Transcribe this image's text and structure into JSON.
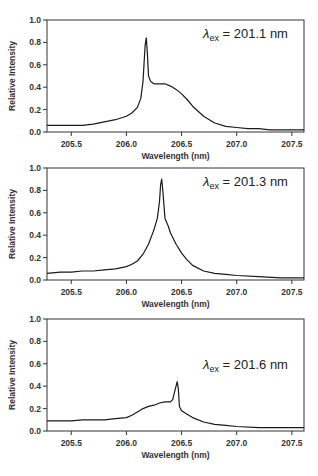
{
  "figure": {
    "panel_count": 3,
    "line_color": "#1a1a1a",
    "frame_color": "#333333"
  },
  "chart_data": [
    {
      "type": "line",
      "title": "",
      "annotation": {
        "symbol": "λ",
        "subscript": "ex",
        "text": " = 201.1 nm"
      },
      "xlabel": "Wavelength (nm)",
      "ylabel": "Relative Intensity",
      "xlim": [
        205.28,
        207.61
      ],
      "ylim": [
        0.0,
        1.0
      ],
      "xticks": [
        205.5,
        206.0,
        206.5,
        207.0,
        207.5
      ],
      "xtick_labels": [
        "205.5",
        "206.0",
        "206.5",
        "207.0",
        "207.5"
      ],
      "yticks": [
        0.0,
        0.2,
        0.4,
        0.6,
        0.8,
        1.0
      ],
      "ytick_labels": [
        "0.0",
        "0.2",
        "0.4",
        "0.6",
        "0.8",
        "1.0"
      ],
      "grid": false,
      "series": [
        {
          "name": "λex = 201.1 nm",
          "x": [
            205.28,
            205.4,
            205.5,
            205.6,
            205.7,
            205.8,
            205.9,
            206.0,
            206.05,
            206.1,
            206.13,
            206.15,
            206.16,
            206.17,
            206.18,
            206.19,
            206.2,
            206.22,
            206.25,
            206.3,
            206.35,
            206.4,
            206.45,
            206.5,
            206.55,
            206.6,
            206.7,
            206.8,
            206.9,
            207.0,
            207.1,
            207.2,
            207.3,
            207.4,
            207.5,
            207.61
          ],
          "y": [
            0.06,
            0.06,
            0.06,
            0.06,
            0.07,
            0.09,
            0.11,
            0.14,
            0.17,
            0.22,
            0.3,
            0.45,
            0.62,
            0.78,
            0.84,
            0.7,
            0.5,
            0.45,
            0.43,
            0.43,
            0.43,
            0.41,
            0.38,
            0.34,
            0.29,
            0.23,
            0.14,
            0.08,
            0.05,
            0.04,
            0.03,
            0.03,
            0.02,
            0.02,
            0.02,
            0.02
          ]
        }
      ]
    },
    {
      "type": "line",
      "title": "",
      "annotation": {
        "symbol": "λ",
        "subscript": "ex",
        "text": " = 201.3 nm"
      },
      "xlabel": "Wavelength (nm)",
      "ylabel": "Relative Intensity",
      "xlim": [
        205.28,
        207.61
      ],
      "ylim": [
        0.0,
        1.0
      ],
      "xticks": [
        205.5,
        206.0,
        206.5,
        207.0,
        207.5
      ],
      "xtick_labels": [
        "205.5",
        "206.0",
        "206.5",
        "207.0",
        "207.5"
      ],
      "yticks": [
        0.0,
        0.2,
        0.4,
        0.6,
        0.8,
        1.0
      ],
      "ytick_labels": [
        "0.0",
        "0.2",
        "0.4",
        "0.6",
        "0.8",
        "1.0"
      ],
      "grid": false,
      "series": [
        {
          "name": "λex = 201.3 nm",
          "x": [
            205.28,
            205.4,
            205.5,
            205.6,
            205.7,
            205.8,
            205.9,
            206.0,
            206.05,
            206.1,
            206.15,
            206.2,
            206.25,
            206.28,
            206.3,
            206.31,
            206.32,
            206.33,
            206.35,
            206.38,
            206.4,
            206.45,
            206.5,
            206.55,
            206.6,
            206.7,
            206.8,
            206.9,
            207.0,
            207.2,
            207.4,
            207.61
          ],
          "y": [
            0.06,
            0.07,
            0.07,
            0.08,
            0.08,
            0.09,
            0.1,
            0.12,
            0.14,
            0.17,
            0.23,
            0.32,
            0.45,
            0.55,
            0.7,
            0.85,
            0.9,
            0.8,
            0.55,
            0.48,
            0.42,
            0.32,
            0.24,
            0.18,
            0.13,
            0.08,
            0.06,
            0.05,
            0.04,
            0.03,
            0.02,
            0.02
          ]
        }
      ]
    },
    {
      "type": "line",
      "title": "",
      "annotation": {
        "symbol": "λ",
        "subscript": "ex",
        "text": " = 201.6 nm"
      },
      "xlabel": "Wavelength (nm)",
      "ylabel": "Relative Intensity",
      "xlim": [
        205.28,
        207.61
      ],
      "ylim": [
        0.0,
        1.0
      ],
      "xticks": [
        205.5,
        206.0,
        206.5,
        207.0,
        207.5
      ],
      "xtick_labels": [
        "205.5",
        "206.0",
        "206.5",
        "207.0",
        "207.5"
      ],
      "yticks": [
        0.0,
        0.2,
        0.4,
        0.6,
        0.8,
        1.0
      ],
      "ytick_labels": [
        "0.0",
        "0.2",
        "0.4",
        "0.6",
        "0.8",
        "1.0"
      ],
      "grid": false,
      "series": [
        {
          "name": "λex = 201.6 nm",
          "x": [
            205.28,
            205.4,
            205.5,
            205.6,
            205.7,
            205.8,
            205.9,
            206.0,
            206.05,
            206.1,
            206.15,
            206.2,
            206.25,
            206.3,
            206.35,
            206.4,
            206.42,
            206.44,
            206.46,
            206.47,
            206.48,
            206.5,
            206.55,
            206.6,
            206.7,
            206.8,
            206.9,
            207.0,
            207.2,
            207.4,
            207.61
          ],
          "y": [
            0.09,
            0.09,
            0.09,
            0.1,
            0.1,
            0.1,
            0.11,
            0.12,
            0.14,
            0.17,
            0.2,
            0.22,
            0.23,
            0.25,
            0.26,
            0.26,
            0.28,
            0.36,
            0.44,
            0.38,
            0.22,
            0.18,
            0.15,
            0.12,
            0.08,
            0.06,
            0.05,
            0.04,
            0.03,
            0.03,
            0.03
          ]
        }
      ]
    }
  ]
}
